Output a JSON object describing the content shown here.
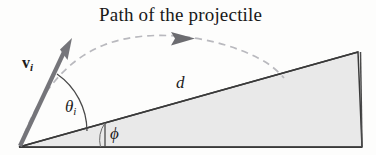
{
  "figure": {
    "background_color": "#fdfdfc",
    "width": 376,
    "height": 155,
    "title": "Path of the projectile"
  },
  "labels": {
    "velocity_symbol": "v",
    "velocity_subscript": "i",
    "theta_symbol": "θ",
    "theta_subscript": "i",
    "phi_symbol": "ϕ",
    "distance_symbol": "d"
  },
  "colors": {
    "text": "#181818",
    "incline_fill": "#e9e9e9",
    "incline_stroke": "#3a3a3a",
    "vector_stroke": "#6f6f72",
    "trajectory_stroke": "#b6b6bb",
    "trajectory_arrow": "#6f6f72",
    "angle_arc": "#4a4a4a"
  },
  "geometry": {
    "incline_apex": [
      19,
      147
    ],
    "incline_top_right": [
      358,
      52
    ],
    "incline_bottom_right": [
      362,
      147
    ],
    "velocity_tail": [
      19,
      147
    ],
    "velocity_tip": [
      71,
      41
    ],
    "trajectory_start": [
      19,
      147
    ],
    "trajectory_end": [
      283,
      78
    ],
    "trajectory_arrow_at": [
      187,
      38
    ],
    "phi_vertical_line_x": 105
  }
}
